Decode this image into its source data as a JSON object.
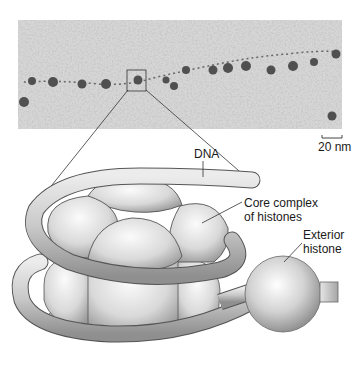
{
  "figure": {
    "type": "nucleosome-diagram",
    "micrograph": {
      "description": "electron micrograph of chromatin showing beads-on-a-string",
      "scale_bar": {
        "label": "20 nm"
      }
    },
    "labels": {
      "dna": "DNA",
      "core_line1": "Core complex",
      "core_line2": "of histones",
      "exterior_line1": "Exterior",
      "exterior_line2": "histone"
    },
    "colors": {
      "micrograph_bg": "#b8b8b8",
      "histone_light": "#f2f2f2",
      "histone_mid": "#cfcfcf",
      "histone_dark": "#8a8a8a",
      "outline": "#4a4a4a",
      "text": "#1a1a1a"
    }
  }
}
